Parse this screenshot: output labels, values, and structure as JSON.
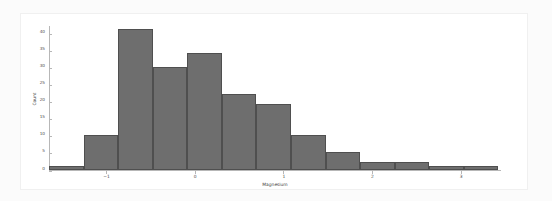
{
  "chart_data": {
    "type": "bar",
    "title": "",
    "subtitle": "",
    "xlabel": "Magnesium",
    "ylabel": "Count",
    "xlim": [
      -1.65,
      3.45
    ],
    "ylim": [
      0,
      42.5
    ],
    "grid": false,
    "legend": null,
    "bar_color": "#6e6e6e",
    "edge_color": "#4f4f4f",
    "background": "#ffffff",
    "page_background": "#fbfbfb",
    "xticks": [
      -1,
      0,
      1,
      2,
      3
    ],
    "xtick_labels": [
      "−1",
      "0",
      "1",
      "2",
      "3"
    ],
    "yticks": [
      0,
      5,
      10,
      15,
      20,
      25,
      30,
      35,
      40
    ],
    "ytick_labels": [
      "0",
      "5",
      "10",
      "15",
      "20",
      "25",
      "30",
      "35",
      "40"
    ],
    "bin_edges": [
      -1.65,
      -1.26,
      -0.87,
      -0.48,
      -0.09,
      0.3,
      0.69,
      1.08,
      1.47,
      1.86,
      2.25,
      2.64,
      3.03,
      3.42
    ],
    "bin_centers": [
      -1.455,
      -1.065,
      -0.675,
      -0.285,
      0.105,
      0.495,
      0.885,
      1.275,
      1.665,
      2.055,
      2.445,
      2.835,
      3.225
    ],
    "values": [
      1,
      10,
      41,
      30,
      34,
      22,
      19,
      10,
      5,
      2,
      2,
      1,
      1
    ],
    "categories": [
      "-1.65 to -1.26",
      "-1.26 to -0.87",
      "-0.87 to -0.48",
      "-0.48 to -0.09",
      "-0.09 to 0.30",
      "0.30 to 0.69",
      "0.69 to 1.08",
      "1.08 to 1.47",
      "1.47 to 1.86",
      "1.86 to 2.25",
      "2.25 to 2.64",
      "2.64 to 3.03",
      "3.03 to 3.42"
    ]
  }
}
